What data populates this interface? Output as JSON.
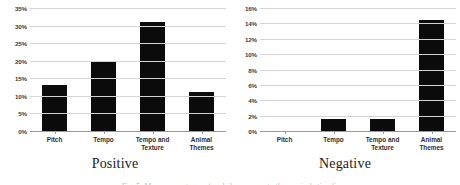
{
  "figure": {
    "caption": "Fig. 5. Mean percentages of coded responses to the musical stimuli."
  },
  "chart_data": [
    {
      "type": "bar",
      "title": "Positive",
      "categories": [
        "Pitch",
        "Tempo",
        "Tempo and Texture",
        "Animal Themes"
      ],
      "values": [
        13,
        19.5,
        31,
        11
      ],
      "xlabel": "",
      "ylabel": "",
      "ylim": [
        0,
        35
      ],
      "ytick_step": 5,
      "ytick_labels": [
        "0%",
        "5%",
        "10%",
        "15%",
        "20%",
        "25%",
        "30%",
        "35%"
      ],
      "ytick_values": [
        0,
        5,
        10,
        15,
        20,
        25,
        30,
        35
      ],
      "grid": true,
      "legend": "none",
      "bar_color": "#0b0b0b",
      "grid_color": "#d4d4d4"
    },
    {
      "type": "bar",
      "title": "Negative",
      "categories": [
        "Pitch",
        "Tempo",
        "Tempo and Texture",
        "Animal Themes"
      ],
      "values": [
        0,
        1.5,
        1.5,
        14.5
      ],
      "xlabel": "",
      "ylabel": "",
      "ylim": [
        0,
        16
      ],
      "ytick_step": 2,
      "ytick_labels": [
        "0%",
        "2%",
        "4%",
        "6%",
        "8%",
        "10%",
        "12%",
        "14%",
        "16%"
      ],
      "ytick_values": [
        0,
        2,
        4,
        6,
        8,
        10,
        12,
        14,
        16
      ],
      "grid": true,
      "legend": "none",
      "bar_color": "#0b0b0b",
      "grid_color": "#d4d4d4"
    }
  ]
}
